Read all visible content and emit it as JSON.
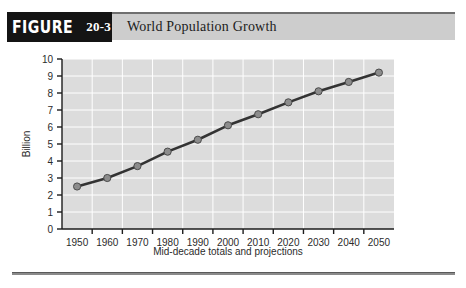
{
  "header": {
    "figure_word": "FIGURE",
    "figure_number": "20-3",
    "title": "World Population Growth"
  },
  "chart_data": {
    "type": "line",
    "title": "World Population Growth",
    "xlabel": "Mid-decade totals and projections",
    "ylabel": "Billion",
    "categories": [
      "1950",
      "1960",
      "1970",
      "1980",
      "1990",
      "2000",
      "2010",
      "2020",
      "2030",
      "2040",
      "2050"
    ],
    "values": [
      2.5,
      3.0,
      3.7,
      4.55,
      5.25,
      6.1,
      6.75,
      7.45,
      8.1,
      8.65,
      9.2
    ],
    "ylim": [
      0,
      10
    ],
    "ytick_labels": [
      "0",
      "1",
      "2",
      "3",
      "4",
      "5",
      "6",
      "7",
      "8",
      "9",
      "10"
    ],
    "grid": true,
    "legend": "none",
    "plot_bgcolor": "#dcdcdc",
    "gridline_color": "#ffffff",
    "line_color": "#333333",
    "marker_color": "#8c8c8c",
    "marker_edge_color": "#4a4a4a"
  }
}
